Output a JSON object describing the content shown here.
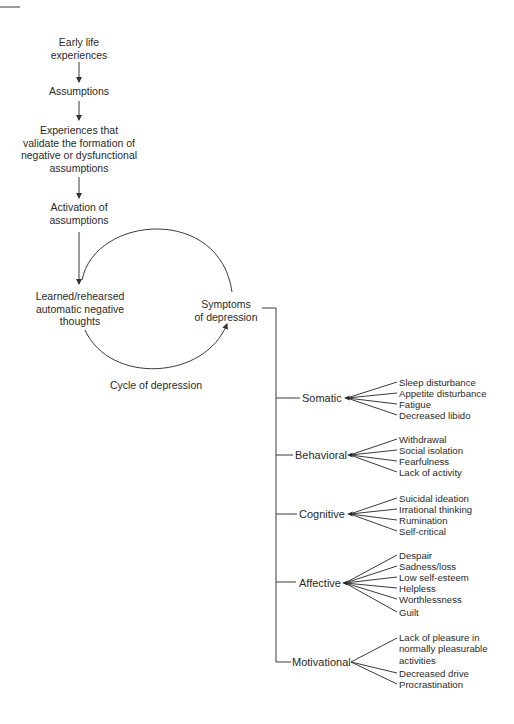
{
  "flow": {
    "early_life": [
      "Early life",
      "experiences"
    ],
    "assumptions": "Assumptions",
    "experiences": [
      "Experiences that",
      "validate the formation of",
      "negative or dysfunctional",
      "assumptions"
    ],
    "activation": [
      "Activation of",
      "assumptions"
    ],
    "learned": [
      "Learned/rehearsed",
      "automatic negative",
      "thoughts"
    ],
    "symptoms": [
      "Symptoms",
      "of depression"
    ],
    "cycle_label": "Cycle of depression"
  },
  "categories": [
    {
      "label": "Somatic",
      "items": [
        "Sleep disturbance",
        "Appetite disturbance",
        "Fatigue",
        "Decreased libido"
      ]
    },
    {
      "label": "Behavioral",
      "items": [
        "Withdrawal",
        "Social isolation",
        "Fearfulness",
        "Lack of activity"
      ]
    },
    {
      "label": "Cognitive",
      "items": [
        "Suicidal ideation",
        "Irrational thinking",
        "Rumination",
        "Self-critical"
      ]
    },
    {
      "label": "Affective",
      "items": [
        "Despair",
        "Sadness/loss",
        "Low self-esteem",
        "Helpless",
        "Worthlessness",
        "Guilt"
      ]
    },
    {
      "label": "Motivational",
      "items": [
        "Lack of pleasure in normally pleasurable activities",
        "Decreased drive",
        "Procrastination"
      ]
    }
  ],
  "colors": {
    "line": "#3a3a3a",
    "text": "#2a2a2a",
    "background": "#ffffff"
  }
}
